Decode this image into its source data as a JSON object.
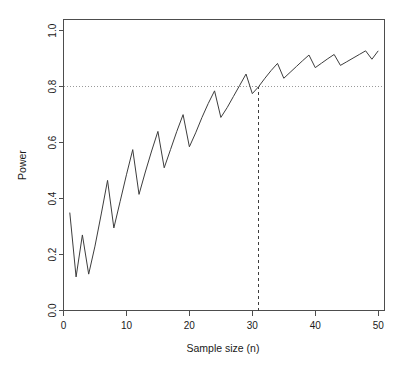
{
  "chart_data": {
    "type": "line",
    "title": "",
    "xlabel": "Sample size (n)",
    "ylabel": "Power",
    "xlim": [
      0,
      51
    ],
    "ylim": [
      0.0,
      1.04
    ],
    "grid": false,
    "legend": "none",
    "x_ticks": [
      "0",
      "10",
      "20",
      "30",
      "40",
      "50"
    ],
    "x_tick_values": [
      0,
      10,
      20,
      30,
      40,
      50
    ],
    "y_ticks": [
      "0.0",
      "0.2",
      "0.4",
      "0.6",
      "0.8",
      "1.0"
    ],
    "y_tick_values": [
      0.0,
      0.2,
      0.4,
      0.6,
      0.8,
      1.0
    ],
    "x": [
      1,
      2,
      3,
      4,
      5,
      6,
      7,
      8,
      9,
      10,
      11,
      12,
      13,
      14,
      15,
      16,
      17,
      18,
      19,
      20,
      21,
      22,
      23,
      24,
      25,
      26,
      27,
      28,
      29,
      30,
      31,
      32,
      33,
      34,
      35,
      36,
      37,
      38,
      39,
      40,
      41,
      42,
      43,
      44,
      45,
      46,
      47,
      48,
      49,
      50
    ],
    "values": [
      0.35,
      0.12,
      0.27,
      0.13,
      0.23,
      0.345,
      0.465,
      0.295,
      0.39,
      0.485,
      0.575,
      0.415,
      0.495,
      0.57,
      0.64,
      0.51,
      0.575,
      0.64,
      0.7,
      0.585,
      0.635,
      0.69,
      0.74,
      0.785,
      0.69,
      0.725,
      0.765,
      0.805,
      0.845,
      0.775,
      0.8,
      0.83,
      0.858,
      0.883,
      0.83,
      0.851,
      0.872,
      0.893,
      0.913,
      0.868,
      0.884,
      0.9,
      0.915,
      0.876,
      0.889,
      0.902,
      0.915,
      0.928,
      0.898,
      0.928
    ],
    "annotations": [
      {
        "kind": "hline",
        "axis": "y",
        "value": 0.8,
        "style": "dotted",
        "label": "power = 0.8"
      },
      {
        "kind": "vline",
        "axis": "x",
        "value": 31,
        "style": "dashed",
        "label": "n = 31"
      }
    ],
    "series": [
      {
        "name": "Power",
        "values": [
          0.35,
          0.12,
          0.27,
          0.13,
          0.23,
          0.345,
          0.465,
          0.295,
          0.39,
          0.485,
          0.575,
          0.415,
          0.495,
          0.57,
          0.64,
          0.51,
          0.575,
          0.64,
          0.7,
          0.585,
          0.635,
          0.69,
          0.74,
          0.785,
          0.69,
          0.725,
          0.765,
          0.805,
          0.845,
          0.775,
          0.8,
          0.83,
          0.858,
          0.883,
          0.83,
          0.851,
          0.872,
          0.893,
          0.913,
          0.868,
          0.884,
          0.9,
          0.915,
          0.876,
          0.889,
          0.902,
          0.915,
          0.928,
          0.898,
          0.928
        ]
      }
    ]
  },
  "colors": {
    "line": "#3d3d3d",
    "axis": "#4d4d4d",
    "reference_dotted": "#9a9a9a",
    "reference_dashed": "#3d3d3d",
    "background": "#ffffff"
  }
}
